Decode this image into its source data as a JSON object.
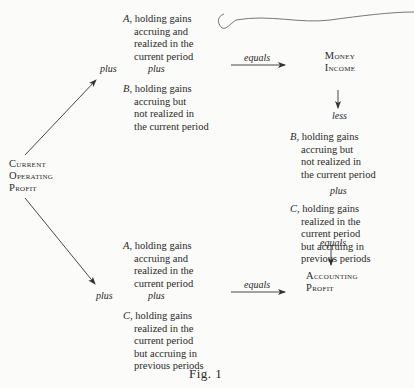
{
  "figure": {
    "caption": "Fig. 1",
    "root": {
      "label_lines": [
        "Current",
        "Operating",
        "Profit"
      ]
    },
    "upper_branch": {
      "operator_left": "plus",
      "operator_mid": "plus",
      "term_a": {
        "letter": "A,",
        "lines": [
          "holding gains",
          "accruing and",
          "realized in the",
          "current period"
        ]
      },
      "term_b": {
        "letter": "B,",
        "lines": [
          "holding gains",
          "accruing but",
          "not realized in",
          "the current period"
        ]
      },
      "arrow_label": "equals",
      "result": {
        "label_lines": [
          "Money",
          "Income"
        ]
      }
    },
    "right_column": {
      "op_less": "less",
      "term_b": {
        "letter": "B,",
        "lines": [
          "holding gains",
          "accruing but",
          "not realized in",
          "the current period"
        ]
      },
      "op_plus": "plus",
      "term_c": {
        "letter": "C,",
        "lines": [
          "holding gains",
          "realized in the",
          "current period",
          "but accruing in",
          "previous periods"
        ]
      },
      "op_equals": "equals",
      "result": {
        "label_lines": [
          "Accounting",
          "Profit"
        ]
      }
    },
    "lower_branch": {
      "operator_left": "plus",
      "operator_mid": "plus",
      "term_a": {
        "letter": "A,",
        "lines": [
          "holding gains",
          "accruing and",
          "realized in the",
          "current period"
        ]
      },
      "term_c": {
        "letter": "C,",
        "lines": [
          "holding gains",
          "realized in the",
          "current period",
          "but accruing in",
          "previous periods"
        ]
      },
      "arrow_label": "equals"
    }
  }
}
